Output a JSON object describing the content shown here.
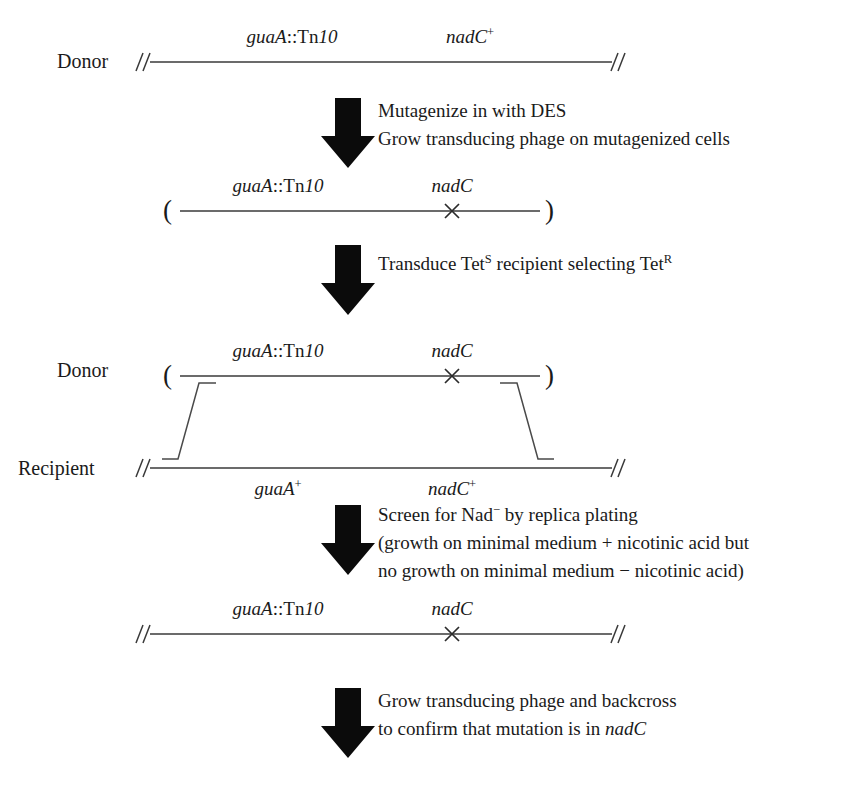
{
  "figure": {
    "kind": "genetic-mapping-flow-diagram",
    "background": "#ffffff",
    "ink": "#1a1a1a"
  },
  "labels": {
    "donor": "Donor",
    "recipient": "Recipient",
    "paren_open": "(",
    "paren_close": ")",
    "break_mark": "//"
  },
  "genes": {
    "guaA_tn10_prefix": "guaA",
    "guaA_tn10_colons": "::",
    "guaA_tn10_tn": "Tn",
    "guaA_tn10_num": "10",
    "nadC": "nadC",
    "nadC_plus_base": "nadC",
    "nadC_plus_sup": "+",
    "guaA_plus_base": "guaA",
    "guaA_plus_sup": "+"
  },
  "rows": [
    {
      "id": "row-donor-initial",
      "role": "Donor",
      "left_label": "guaA::Tn10",
      "right_label": "nadC+",
      "mutation_x": false,
      "parenthesized": false,
      "broken_ends": true
    },
    {
      "id": "row-mutagenized-phage",
      "role": "",
      "left_label": "guaA::Tn10",
      "right_label": "nadC",
      "mutation_x": true,
      "parenthesized": true,
      "broken_ends": false
    },
    {
      "id": "row-donor-crossover",
      "role": "Donor",
      "left_label": "guaA::Tn10",
      "right_label": "nadC",
      "mutation_x": true,
      "parenthesized": true,
      "broken_ends": false
    },
    {
      "id": "row-recipient-crossover",
      "role": "Recipient",
      "left_label": "guaA+",
      "right_label": "nadC+",
      "mutation_x": false,
      "parenthesized": false,
      "broken_ends": true
    },
    {
      "id": "row-final-recombinant",
      "role": "",
      "left_label": "guaA::Tn10",
      "right_label": "nadC",
      "mutation_x": true,
      "parenthesized": false,
      "broken_ends": true
    }
  ],
  "steps": [
    {
      "id": "step-mutagenize",
      "lines": [
        "Mutagenize in with DES",
        "Grow transducing phage on mutagenized cells"
      ]
    },
    {
      "id": "step-transduce",
      "lines_rich": {
        "pre": "Transduce Tet",
        "sup1": "S",
        "mid": " recipient selecting Tet",
        "sup2": "R"
      }
    },
    {
      "id": "step-screen",
      "lines": [
        "Screen for Nad− by replica plating",
        "(growth on minimal medium + nicotinic acid but",
        "no growth on minimal medium − nicotinic acid)"
      ],
      "line1_rich": {
        "pre": "Screen for Nad",
        "sup": "−",
        "post": " by replica plating"
      }
    },
    {
      "id": "step-backcross",
      "lines": [
        "Grow transducing phage and backcross",
        "to confirm that mutation is in nadC"
      ],
      "line2_rich": {
        "pre": "to confirm that mutation is in ",
        "gene": "nadC"
      }
    }
  ]
}
